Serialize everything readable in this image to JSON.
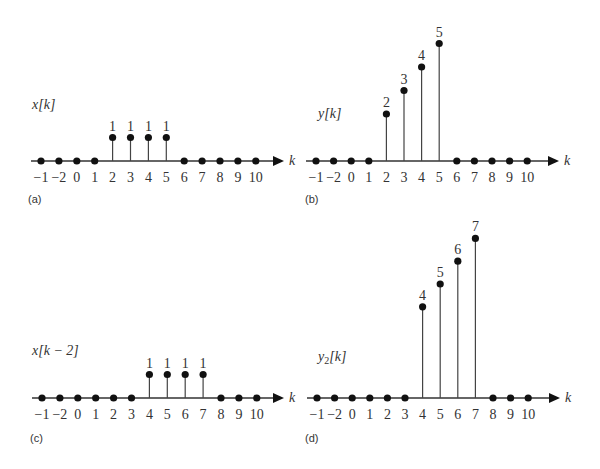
{
  "chart_data": [
    {
      "type": "stem",
      "panel_label": "(a)",
      "title": "",
      "ylabel": "x[k]",
      "xlabel": "k",
      "categories": [
        "−1",
        "−2",
        "0",
        "1",
        "2",
        "3",
        "4",
        "5",
        "6",
        "7",
        "8",
        "9",
        "10"
      ],
      "values": [
        0,
        0,
        0,
        0,
        1,
        1,
        1,
        1,
        0,
        0,
        0,
        0,
        0
      ],
      "value_labels": [
        "",
        "",
        "",
        "",
        "1",
        "1",
        "1",
        "1",
        "",
        "",
        "",
        "",
        ""
      ],
      "grid": false
    },
    {
      "type": "stem",
      "panel_label": "(b)",
      "title": "",
      "ylabel": "y[k]",
      "xlabel": "k",
      "categories": [
        "−1",
        "−2",
        "0",
        "1",
        "2",
        "3",
        "4",
        "5",
        "6",
        "7",
        "8",
        "9",
        "10"
      ],
      "values": [
        0,
        0,
        0,
        0,
        2,
        3,
        4,
        5,
        0,
        0,
        0,
        0,
        0
      ],
      "value_labels": [
        "",
        "",
        "",
        "",
        "2",
        "3",
        "4",
        "5",
        "",
        "",
        "",
        "",
        ""
      ],
      "grid": false
    },
    {
      "type": "stem",
      "panel_label": "(c)",
      "title": "",
      "ylabel": "x[k − 2]",
      "xlabel": "k",
      "categories": [
        "−1",
        "−2",
        "0",
        "1",
        "2",
        "3",
        "4",
        "5",
        "6",
        "7",
        "8",
        "9",
        "10"
      ],
      "values": [
        0,
        0,
        0,
        0,
        0,
        0,
        1,
        1,
        1,
        1,
        0,
        0,
        0
      ],
      "value_labels": [
        "",
        "",
        "",
        "",
        "",
        "",
        "1",
        "1",
        "1",
        "1",
        "",
        "",
        ""
      ],
      "grid": false
    },
    {
      "type": "stem",
      "panel_label": "(d)",
      "title": "",
      "ylabel": "y2[k]",
      "ylabel_base": "y",
      "ylabel_sub": "2",
      "ylabel_tail": "[k]",
      "xlabel": "k",
      "categories": [
        "−1",
        "−2",
        "0",
        "1",
        "2",
        "3",
        "4",
        "5",
        "6",
        "7",
        "8",
        "9",
        "10"
      ],
      "values": [
        0,
        0,
        0,
        0,
        0,
        0,
        4,
        5,
        6,
        7,
        0,
        0,
        0
      ],
      "value_labels": [
        "",
        "",
        "",
        "",
        "",
        "",
        "4",
        "5",
        "6",
        "7",
        "",
        "",
        ""
      ],
      "grid": false
    }
  ],
  "layout": {
    "panels": [
      {
        "x0": 41,
        "step": 17.9,
        "axis_y": 161,
        "unit_px": 23.5,
        "axis_start": 31,
        "axis_end": 284,
        "ylab_x": 32,
        "ylab_y": 109,
        "panel_x": 28,
        "panel_y": 203,
        "tick_y": 182
      },
      {
        "x0": 316,
        "step": 17.6,
        "axis_start": 306,
        "axis_end": 559,
        "axis_y": 161,
        "unit_px": 23.5,
        "ylab_x": 318,
        "ylab_y": 118,
        "panel_x": 305,
        "panel_y": 203,
        "tick_y": 182
      },
      {
        "x0": 42,
        "step": 17.9,
        "axis_start": 32,
        "axis_end": 284,
        "axis_y": 398,
        "unit_px": 23.5,
        "ylab_x": 32,
        "ylab_y": 355,
        "panel_x": 30,
        "panel_y": 442,
        "tick_y": 419
      },
      {
        "x0": 317,
        "step": 17.6,
        "axis_start": 307,
        "axis_end": 560,
        "axis_y": 398,
        "unit_px": 22.8,
        "ylab_x": 318,
        "ylab_y": 361,
        "panel_x": 305,
        "panel_y": 442,
        "tick_y": 419
      }
    ],
    "colors": {
      "ink": "#111111",
      "stem": "#444444",
      "axis": "#333333"
    }
  }
}
